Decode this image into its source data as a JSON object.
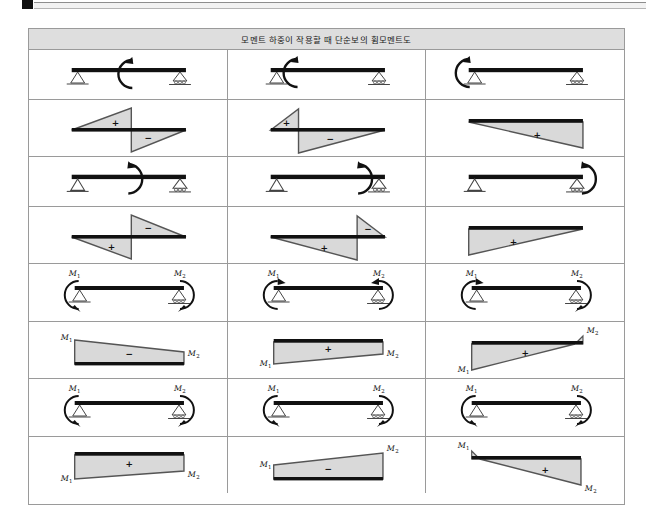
{
  "page": {
    "top_mark": "black-corner-mark",
    "rule": "gray-double-rule"
  },
  "table": {
    "title": "모멘트 하중이 작용할 때 단순보의 휨모멘트도",
    "columns": 3,
    "rows": 8,
    "colors": {
      "header_bg": "#dedede",
      "grid": "#9a9a9a",
      "beam": "#111111",
      "diagram_fill": "#d9d9d9",
      "diagram_stroke": "#555555",
      "text": "#1a1a1a"
    },
    "labels": {
      "plus": "+",
      "minus": "−",
      "m1": "M",
      "m1_sub": "1",
      "m2": "M",
      "m2_sub": "2"
    },
    "cells": [
      {
        "id": "r1c1",
        "kind": "beam",
        "row": 1,
        "col": 1,
        "support_left": "pin",
        "support_right": "roller",
        "moment_position": "mid",
        "moment_direction": "clockwise",
        "end_labels": []
      },
      {
        "id": "r1c2",
        "kind": "beam",
        "row": 1,
        "col": 2,
        "support_left": "pin",
        "support_right": "roller",
        "moment_position": "left-quarter",
        "moment_direction": "clockwise",
        "end_labels": []
      },
      {
        "id": "r1c3",
        "kind": "beam",
        "row": 1,
        "col": 3,
        "support_left": "pin",
        "support_right": "roller",
        "moment_position": "left-end",
        "moment_direction": "clockwise",
        "end_labels": []
      },
      {
        "id": "r2c1",
        "kind": "diagram",
        "row": 2,
        "col": 1,
        "shape": "two-triangles",
        "signs": [
          "+",
          "−"
        ],
        "note": "positive triangle above-left, negative triangle below-right"
      },
      {
        "id": "r2c2",
        "kind": "diagram",
        "row": 2,
        "col": 2,
        "shape": "two-triangles-small-left",
        "signs": [
          "+",
          "−"
        ],
        "note": "small positive triangle at left, large negative below"
      },
      {
        "id": "r2c3",
        "kind": "diagram",
        "row": 2,
        "col": 3,
        "shape": "triangle-rising",
        "signs": [
          "+"
        ],
        "note": "single positive triangle below beam rising to right"
      },
      {
        "id": "r3c1",
        "kind": "beam",
        "row": 3,
        "col": 1,
        "support_left": "pin",
        "support_right": "roller",
        "moment_position": "mid",
        "moment_direction": "counterclockwise",
        "end_labels": []
      },
      {
        "id": "r3c2",
        "kind": "beam",
        "row": 3,
        "col": 2,
        "support_left": "pin",
        "support_right": "roller",
        "moment_position": "right-quarter",
        "moment_direction": "counterclockwise",
        "end_labels": []
      },
      {
        "id": "r3c3",
        "kind": "beam",
        "row": 3,
        "col": 3,
        "support_left": "pin",
        "support_right": "roller",
        "moment_position": "right-end",
        "moment_direction": "counterclockwise",
        "end_labels": []
      },
      {
        "id": "r4c1",
        "kind": "diagram",
        "row": 4,
        "col": 1,
        "shape": "two-triangles-inverted",
        "signs": [
          "−",
          "+"
        ],
        "note": "negative triangle above-right, positive triangle below-left"
      },
      {
        "id": "r4c2",
        "kind": "diagram",
        "row": 4,
        "col": 2,
        "shape": "two-triangles-small-right",
        "signs": [
          "+",
          "−"
        ],
        "note": "large positive triangle below, small negative at right"
      },
      {
        "id": "r4c3",
        "kind": "diagram",
        "row": 4,
        "col": 3,
        "shape": "triangle-falling",
        "signs": [
          "+"
        ],
        "note": "single positive triangle below beam descending to right"
      },
      {
        "id": "r5c1",
        "kind": "beam",
        "row": 5,
        "col": 1,
        "support_left": "pin",
        "support_right": "roller",
        "moment_position": "both-ends",
        "moment_direction": "both-ccw",
        "end_labels": [
          "M1",
          "M2"
        ]
      },
      {
        "id": "r5c2",
        "kind": "beam",
        "row": 5,
        "col": 2,
        "support_left": "pin",
        "support_right": "roller",
        "moment_position": "both-ends",
        "moment_direction": "left-cw-right-ccw",
        "end_labels": [
          "M1",
          "M2"
        ]
      },
      {
        "id": "r5c3",
        "kind": "beam",
        "row": 5,
        "col": 3,
        "support_left": "pin",
        "support_right": "roller",
        "moment_position": "both-ends",
        "moment_direction": "left-cw-right-cw",
        "end_labels": [
          "M1",
          "M2"
        ]
      },
      {
        "id": "r6c1",
        "kind": "diagram",
        "row": 6,
        "col": 1,
        "shape": "trapezoid-above-descending",
        "signs": [
          "−"
        ],
        "end_labels": [
          "M1",
          "M2"
        ],
        "note": "trapezoid above beam, taller at M1"
      },
      {
        "id": "r6c2",
        "kind": "diagram",
        "row": 6,
        "col": 2,
        "shape": "trapezoid-below-ascending",
        "signs": [
          "+"
        ],
        "end_labels": [
          "M1",
          "M2"
        ],
        "note": "trapezoid below beam, taller at M2"
      },
      {
        "id": "r6c3",
        "kind": "diagram",
        "row": 6,
        "col": 3,
        "shape": "crossing-triangles",
        "signs": [
          "+"
        ],
        "end_labels": [
          "M1",
          "M2"
        ],
        "note": "large positive triangle from M1, small sliver at M2"
      },
      {
        "id": "r7c1",
        "kind": "beam",
        "row": 7,
        "col": 1,
        "support_left": "pin",
        "support_right": "roller",
        "moment_position": "both-ends",
        "moment_direction": "both-cw",
        "end_labels": [
          "M1",
          "M2"
        ]
      },
      {
        "id": "r7c2",
        "kind": "beam",
        "row": 7,
        "col": 2,
        "support_left": "pin",
        "support_right": "roller",
        "moment_position": "both-ends",
        "moment_direction": "left-ccw-right-cw",
        "end_labels": [
          "M1",
          "M2"
        ]
      },
      {
        "id": "r7c3",
        "kind": "beam",
        "row": 7,
        "col": 3,
        "support_left": "pin",
        "support_right": "roller",
        "moment_position": "both-ends",
        "moment_direction": "both-cw-alt",
        "end_labels": [
          "M1",
          "M2"
        ]
      },
      {
        "id": "r8c1",
        "kind": "diagram",
        "row": 8,
        "col": 1,
        "shape": "trapezoid-below-descending",
        "signs": [
          "+"
        ],
        "end_labels": [
          "M1",
          "M2"
        ],
        "note": "trapezoid under beam, taller at M1"
      },
      {
        "id": "r8c2",
        "kind": "diagram",
        "row": 8,
        "col": 2,
        "shape": "trapezoid-above-ascending",
        "signs": [
          "−"
        ],
        "end_labels": [
          "M1",
          "M2"
        ],
        "note": "trapezoid above beam, taller at M2"
      },
      {
        "id": "r8c3",
        "kind": "diagram",
        "row": 8,
        "col": 3,
        "shape": "crossing-triangles-reverse",
        "signs": [
          "+"
        ],
        "end_labels": [
          "M1",
          "M2"
        ],
        "note": "small sliver at M1, large positive triangle to M2"
      }
    ]
  }
}
